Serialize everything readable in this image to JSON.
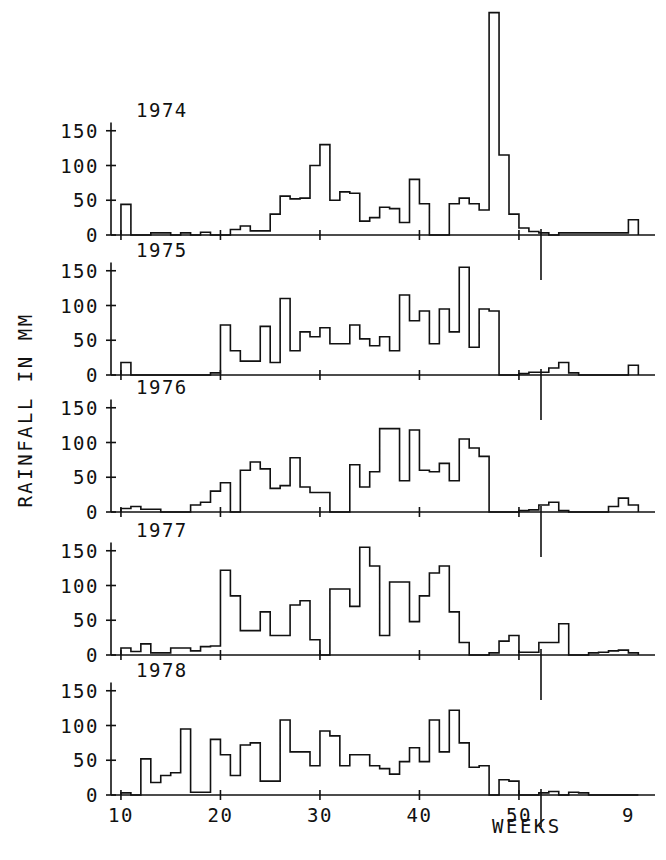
{
  "chart_data": {
    "type": "line",
    "title": "",
    "xlabel": "WEEKS",
    "ylabel": "RAINFALL IN MM",
    "grid": false,
    "legend_position": "none",
    "plot_style": "step",
    "xlim": [
      9,
      61
    ],
    "ylim": [
      0,
      330
    ],
    "x_tick_labels": [
      "10",
      "20",
      "30",
      "40",
      "50",
      "9"
    ],
    "x_tick_values": [
      10,
      20,
      30,
      40,
      50,
      61
    ],
    "y_tick_labels": [
      "0",
      "50",
      "100",
      "150"
    ],
    "y_tick_values": [
      0,
      50,
      100,
      150
    ],
    "panel_labels": [
      "1974",
      "1975",
      "1976",
      "1977",
      "1978"
    ],
    "x_note": "weeks 10 through 52 of the labelled year, continuing into weeks 1-9 of the following year",
    "series": [
      {
        "name": "1974",
        "x": [
          10,
          11,
          12,
          13,
          14,
          15,
          16,
          17,
          18,
          19,
          20,
          21,
          22,
          23,
          24,
          25,
          26,
          27,
          28,
          29,
          30,
          31,
          32,
          33,
          34,
          35,
          36,
          37,
          38,
          39,
          40,
          41,
          42,
          43,
          44,
          45,
          46,
          47,
          48,
          49,
          50,
          51,
          52,
          53,
          54,
          55,
          56,
          57,
          58,
          59,
          60,
          61
        ],
        "values": [
          44,
          0,
          0,
          3,
          3,
          0,
          3,
          0,
          4,
          0,
          0,
          8,
          13,
          6,
          6,
          30,
          56,
          52,
          53,
          100,
          130,
          50,
          62,
          60,
          20,
          25,
          40,
          38,
          18,
          80,
          45,
          0,
          0,
          45,
          53,
          45,
          36,
          320,
          115,
          30,
          10,
          5,
          3,
          0,
          3,
          3,
          3,
          3,
          3,
          3,
          3,
          22
        ]
      },
      {
        "name": "1975",
        "x": [
          10,
          11,
          12,
          13,
          14,
          15,
          16,
          17,
          18,
          19,
          20,
          21,
          22,
          23,
          24,
          25,
          26,
          27,
          28,
          29,
          30,
          31,
          32,
          33,
          34,
          35,
          36,
          37,
          38,
          39,
          40,
          41,
          42,
          43,
          44,
          45,
          46,
          47,
          48,
          49,
          50,
          51,
          52,
          53,
          54,
          55,
          56,
          57,
          58,
          59,
          60,
          61
        ],
        "values": [
          18,
          0,
          0,
          0,
          0,
          0,
          0,
          0,
          0,
          3,
          72,
          35,
          20,
          20,
          70,
          18,
          110,
          35,
          62,
          55,
          68,
          45,
          45,
          72,
          52,
          42,
          55,
          35,
          115,
          78,
          92,
          45,
          95,
          62,
          155,
          40,
          95,
          92,
          0,
          0,
          2,
          4,
          4,
          10,
          18,
          3,
          0,
          0,
          0,
          0,
          0,
          14
        ]
      },
      {
        "name": "1976",
        "x": [
          10,
          11,
          12,
          13,
          14,
          15,
          16,
          17,
          18,
          19,
          20,
          21,
          22,
          23,
          24,
          25,
          26,
          27,
          28,
          29,
          30,
          31,
          32,
          33,
          34,
          35,
          36,
          37,
          38,
          39,
          40,
          41,
          42,
          43,
          44,
          45,
          46,
          47,
          48,
          49,
          50,
          51,
          52,
          53,
          54,
          55,
          56,
          57,
          58,
          59,
          60,
          61
        ],
        "values": [
          5,
          8,
          4,
          4,
          0,
          0,
          0,
          10,
          14,
          30,
          42,
          0,
          60,
          72,
          62,
          34,
          38,
          78,
          36,
          28,
          28,
          0,
          0,
          68,
          36,
          58,
          120,
          120,
          45,
          118,
          60,
          58,
          70,
          45,
          105,
          92,
          80,
          0,
          0,
          0,
          2,
          3,
          10,
          14,
          2,
          0,
          0,
          0,
          0,
          8,
          20,
          10
        ]
      },
      {
        "name": "1977",
        "x": [
          10,
          11,
          12,
          13,
          14,
          15,
          16,
          17,
          18,
          19,
          20,
          21,
          22,
          23,
          24,
          25,
          26,
          27,
          28,
          29,
          30,
          31,
          32,
          33,
          34,
          35,
          36,
          37,
          38,
          39,
          40,
          41,
          42,
          43,
          44,
          45,
          46,
          47,
          48,
          49,
          50,
          51,
          52,
          53,
          54,
          55,
          56,
          57,
          58,
          59,
          60,
          61
        ],
        "values": [
          10,
          5,
          16,
          3,
          3,
          10,
          10,
          6,
          12,
          13,
          122,
          85,
          35,
          35,
          62,
          28,
          28,
          72,
          78,
          22,
          0,
          95,
          95,
          70,
          155,
          128,
          28,
          105,
          105,
          48,
          85,
          118,
          128,
          62,
          18,
          0,
          0,
          3,
          20,
          28,
          4,
          4,
          18,
          18,
          45,
          0,
          0,
          3,
          4,
          6,
          7,
          3
        ]
      },
      {
        "name": "1978",
        "x": [
          10,
          11,
          12,
          13,
          14,
          15,
          16,
          17,
          18,
          19,
          20,
          21,
          22,
          23,
          24,
          25,
          26,
          27,
          28,
          29,
          30,
          31,
          32,
          33,
          34,
          35,
          36,
          37,
          38,
          39,
          40,
          41,
          42,
          43,
          44,
          45,
          46,
          47,
          48,
          49,
          50,
          51,
          52,
          53,
          54,
          55,
          56,
          57,
          58,
          59,
          60,
          61
        ],
        "values": [
          3,
          0,
          52,
          18,
          28,
          32,
          95,
          4,
          4,
          80,
          58,
          28,
          72,
          75,
          20,
          20,
          108,
          62,
          62,
          42,
          92,
          85,
          42,
          58,
          58,
          42,
          38,
          30,
          48,
          68,
          48,
          108,
          62,
          122,
          75,
          40,
          42,
          0,
          22,
          20,
          0,
          0,
          3,
          5,
          0,
          4,
          3,
          0,
          0,
          0,
          0,
          0
        ]
      }
    ]
  },
  "axis": {
    "y_title": "RAINFALL IN MM",
    "x_title": "WEEKS"
  }
}
